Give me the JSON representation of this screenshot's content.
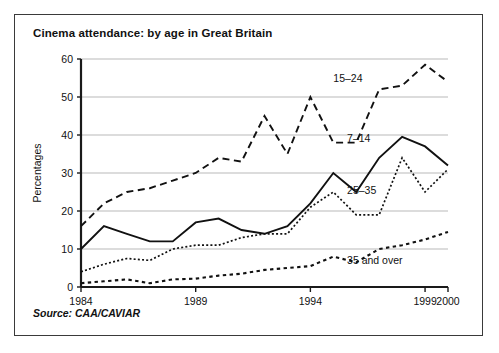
{
  "figure": {
    "title": "Cinema attendance: by age in Great Britain",
    "source": "Source: CAA/CAVIAR"
  },
  "chart_data": {
    "type": "line",
    "title": "Cinema attendance: by age in Great Britain",
    "xlabel": "",
    "ylabel": "Percentages",
    "xlim": [
      1984,
      2000
    ],
    "ylim": [
      0,
      60
    ],
    "yticks": [
      0,
      10,
      20,
      30,
      40,
      50,
      60
    ],
    "xticks": [
      1984,
      1989,
      1994,
      1999,
      2000
    ],
    "xtick_labels": [
      "1984",
      "1989",
      "1994",
      "1999",
      "2000"
    ],
    "ytick_labels": [
      "0",
      "10",
      "20",
      "30",
      "40",
      "50",
      "60"
    ],
    "grid": "horizontal",
    "legend": "inline-annotations",
    "x": [
      1984,
      1985,
      1986,
      1987,
      1988,
      1989,
      1990,
      1991,
      1992,
      1993,
      1994,
      1995,
      1996,
      1997,
      1998,
      1999,
      2000
    ],
    "series": [
      {
        "name": "15–24",
        "style": "dashed",
        "label_x": 1995.0,
        "label_y": 55.0,
        "values": [
          16,
          22,
          25,
          26,
          28,
          30,
          34,
          33,
          45,
          35,
          50,
          38,
          38,
          52,
          53,
          58.5,
          54
        ]
      },
      {
        "name": "7–14",
        "style": "solid",
        "label_x": 1995.6,
        "label_y": 39.0,
        "values": [
          10,
          16,
          14,
          12,
          12,
          17,
          18,
          15,
          14,
          16,
          22,
          30,
          25,
          34,
          39.5,
          37,
          32
        ]
      },
      {
        "name": "25–35",
        "style": "dotted-fine",
        "label_x": 1995.6,
        "label_y": 25.5,
        "values": [
          4,
          6,
          7.5,
          7,
          10,
          11,
          11,
          13,
          14,
          14,
          21,
          25,
          19,
          19,
          34,
          25,
          31
        ]
      },
      {
        "name": "35 and over",
        "style": "dotted-coarse",
        "label_x": 1995.6,
        "label_y": 7.0,
        "values": [
          1,
          1.5,
          2,
          1,
          2,
          2.2,
          3,
          3.5,
          4.5,
          5,
          5.5,
          8,
          6.5,
          10,
          11,
          12.5,
          14.5
        ]
      }
    ]
  }
}
